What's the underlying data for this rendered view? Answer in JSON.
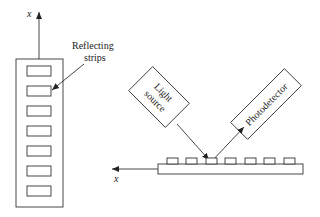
{
  "diagram": {
    "type": "optical-encoder-schematic",
    "left_view": {
      "axis_label": "x",
      "strip_count": 7,
      "callout_label_line1": "Reflecting",
      "callout_label_line2": "strips"
    },
    "right_view": {
      "light_source_line1": "Light",
      "light_source_line2": "source",
      "photodetector_label": "Photodetector",
      "axis_label": "x",
      "strip_count": 7
    },
    "colors": {
      "line": "#333333",
      "text": "#222222",
      "background": "#ffffff"
    }
  }
}
